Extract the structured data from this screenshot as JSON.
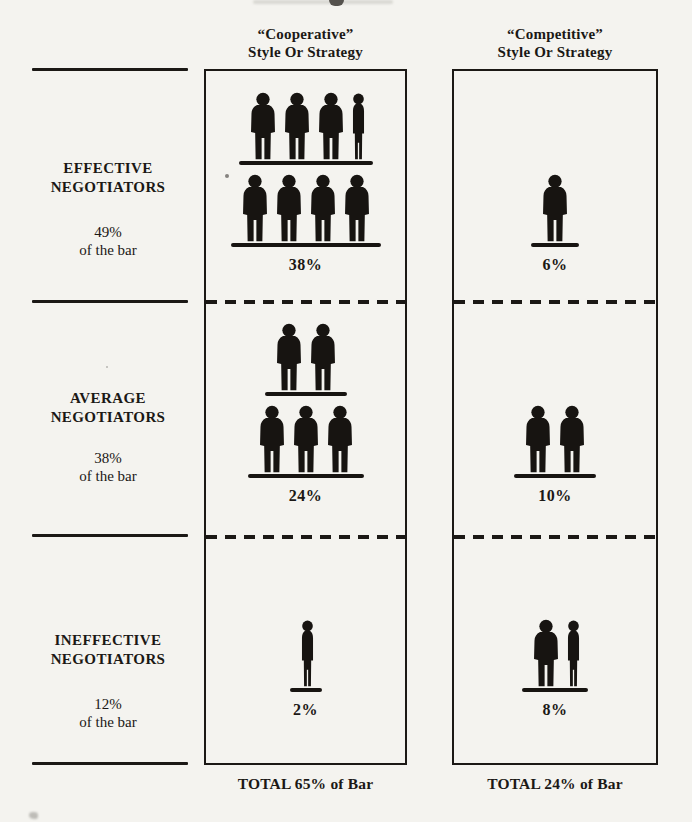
{
  "columns": {
    "cooperative": {
      "header_line1": "“Cooperative”",
      "header_line2": "Style Or Strategy",
      "total": "TOTAL 65% of Bar"
    },
    "competitive": {
      "header_line1": "“Competitive”",
      "header_line2": "Style Or Strategy",
      "total": "TOTAL 24% of Bar"
    }
  },
  "sections": [
    {
      "label_line1": "EFFECTIVE",
      "label_line2": "NEGOTIATORS",
      "share_line1": "49%",
      "share_line2": "of the bar",
      "cooperative": {
        "percent": "38%",
        "rows": [
          {
            "full": 3,
            "partial": 1
          },
          {
            "full": 4,
            "partial": 0
          }
        ]
      },
      "competitive": {
        "percent": "6%",
        "rows": [
          {
            "full": 1,
            "partial": 0
          }
        ]
      }
    },
    {
      "label_line1": "AVERAGE",
      "label_line2": "NEGOTIATORS",
      "share_line1": "38%",
      "share_line2": "of the bar",
      "cooperative": {
        "percent": "24%",
        "rows": [
          {
            "full": 2,
            "partial": 0
          },
          {
            "full": 3,
            "partial": 0
          }
        ]
      },
      "competitive": {
        "percent": "10%",
        "rows": [
          {
            "full": 2,
            "partial": 0
          }
        ]
      }
    },
    {
      "label_line1": "INEFFECTIVE",
      "label_line2": "NEGOTIATORS",
      "share_line1": "12%",
      "share_line2": "of the bar",
      "cooperative": {
        "percent": "2%",
        "rows": [
          {
            "full": 0,
            "partial": 1
          }
        ]
      },
      "competitive": {
        "percent": "8%",
        "rows": [
          {
            "full": 1,
            "partial": 1
          }
        ]
      }
    }
  ],
  "chart_data": {
    "type": "table",
    "title": "",
    "columns": [
      "“Cooperative” Style Or Strategy",
      "“Competitive” Style Or Strategy"
    ],
    "rows": [
      {
        "category": "Effective Negotiators",
        "row_share_of_bar": "49% of the bar",
        "cooperative_pct": 38,
        "competitive_pct": 6
      },
      {
        "category": "Average Negotiators",
        "row_share_of_bar": "38% of the bar",
        "cooperative_pct": 24,
        "competitive_pct": 10
      },
      {
        "category": "Ineffective Negotiators",
        "row_share_of_bar": "12% of the bar",
        "cooperative_pct": 2,
        "competitive_pct": 8
      }
    ],
    "column_totals": [
      "TOTAL 65% of Bar",
      "TOTAL 24% of Bar"
    ],
    "figure_rows_cooperative": [
      [
        3.5,
        4
      ],
      [
        2,
        3
      ],
      [
        0.5
      ]
    ],
    "figure_rows_competitive": [
      [
        1
      ],
      [
        2
      ],
      [
        1.5
      ]
    ],
    "unit": "%"
  }
}
